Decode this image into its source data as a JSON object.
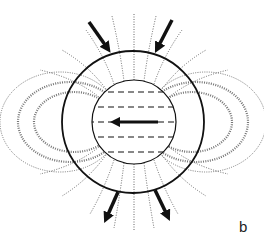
{
  "figure": {
    "panel_label": "b",
    "colors": {
      "stroke": "#111111",
      "field_lines": "#777777",
      "background": "#ffffff"
    },
    "outer_circle": {
      "cx": 133,
      "cy": 122,
      "r": 71
    },
    "inner_circle": {
      "cx": 134,
      "cy": 122,
      "r": 42
    },
    "dashed_lines_y": [
      92,
      107,
      122,
      137,
      152
    ],
    "central_arrow": {
      "from": [
        158,
        122
      ],
      "to": [
        112,
        122
      ],
      "direction": "left"
    },
    "flow_arrows": [
      {
        "name": "top-left-arrow",
        "from": [
          89,
          22
        ],
        "to": [
          110,
          52
        ]
      },
      {
        "name": "top-right-arrow",
        "from": [
          172,
          20
        ],
        "to": [
          155,
          52
        ]
      },
      {
        "name": "bottom-left-arrow",
        "from": [
          118,
          192
        ],
        "to": [
          104,
          222
        ]
      },
      {
        "name": "bottom-right-arrow",
        "from": [
          155,
          190
        ],
        "to": [
          170,
          220
        ]
      }
    ]
  }
}
